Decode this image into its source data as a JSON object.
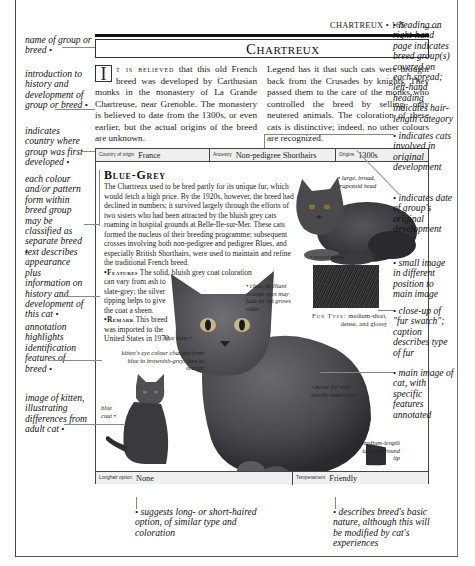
{
  "page": {
    "running_head": "CHARTREUX • 165",
    "title": "Chartreux"
  },
  "intro": {
    "dropcap": "I",
    "lead_smallcaps": "t is believed",
    "col1_text": " that this old French breed was developed by Carthusian monks in the monastery of La Grande Chartreuse, near Grenoble. The monastery is believed to date from the 1300s, or even earlier, but the actual origins of the breed are unknown.",
    "col2_text": "Legend has it that such cats were brought back from the Crusades by knights. They passed them to the care of the monks who controlled the breed by selling only neutered animals. The coloration of these cats is distinctive; indeed, no other colours are recognized."
  },
  "info_top": {
    "country_label": "Country of origin",
    "country_value": "France",
    "ancestry_label": "Ancestry",
    "ancestry_value": "Non-pedigree Shorthairs",
    "origins_label": "Origins",
    "origins_value": "1300s"
  },
  "info_bottom": {
    "longhair_label": "Longhair option",
    "longhair_value": "None",
    "temperament_label": "Temperament",
    "temperament_value": "Friendly"
  },
  "breed": {
    "name": "Blue-Grey",
    "description": "The Chartreux used to be bred partly for its unique fur, which would fetch a high price. By the 1920s, however, the breed had declined in numbers; it survived largely through the efforts of two sisters who had been attracted by the bluish grey cats roaming in hospital grounds at Belle-Ile-sur-Mer. These cats formed the nucleus of their breeding programme; subsequent crosses involving both non-pedigree and pedigree Blues, and especially British Shorthairs, were used to maintain and refine the traditional French breed.",
    "features_label": "•Features",
    "features_text_wide": " The solid, bluish grey coat coloration",
    "features_text_narrow": "can vary from ash to slate-grey; the silver tipping helps to give the coat a sheen.",
    "remark_label": "•Remark",
    "remark_text": " This breed was imported to the United States in 1970."
  },
  "fur": {
    "caption_label": "Fur Type:",
    "caption_text": " medium-short, dense, and glossy"
  },
  "cat_annotations": {
    "head": "large, broad, trapezoid head",
    "paws": "round paws",
    "eyes": "clear, brilliant orange eyes may fade as cat grows older",
    "nose": "blue nose",
    "kitten_eyes": "kitten's eye colour changes from blue to brownish-grey, then to orange",
    "blue_coat": "blue coat",
    "fur": "dense fur with woolly undercoat",
    "body": "muscular body",
    "tail": "medium-length tail with round tip"
  },
  "margin_annotations": {
    "left": [
      "name of group or breed",
      "introduction to history and development of group or breed",
      "indicates country where group was first developed",
      "each colour and/or pattern form within breed group may be classified as separate breed",
      "text describes appearance plus information on history and development of this cat",
      "annotation highlights identification features of breed",
      "image of kitten, illustrating differences from adult cat"
    ],
    "right": [
      "heading on right-hand page indicates breed group(s) covered on each spread; left-hand heading indicates hair-length category",
      "indicates cats involved in original development",
      "indicates date of group's original development",
      "small image in different position to main image",
      "close-up of \"fur swatch\"; caption describes type of fur",
      "main image of cat, with specific features annotated"
    ],
    "bottom": [
      "suggests long- or short-haired option, of similar type and coloration",
      "describes breed's basic nature, although this will be modified by cat's experiences"
    ]
  },
  "colors": {
    "cat_fur": "#4a4a4e",
    "info_bar": "#efefef",
    "text": "#1a1a1a"
  }
}
